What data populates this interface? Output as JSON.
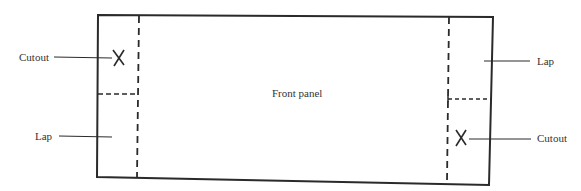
{
  "diagram": {
    "center_label": "Front panel",
    "left": {
      "cutout_label": "Cutout",
      "lap_label": "Lap",
      "cutout_mark": "X"
    },
    "right": {
      "lap_label": "Lap",
      "cutout_label": "Cutout",
      "cutout_mark": "X"
    },
    "line_color": "#2a2a2a"
  }
}
